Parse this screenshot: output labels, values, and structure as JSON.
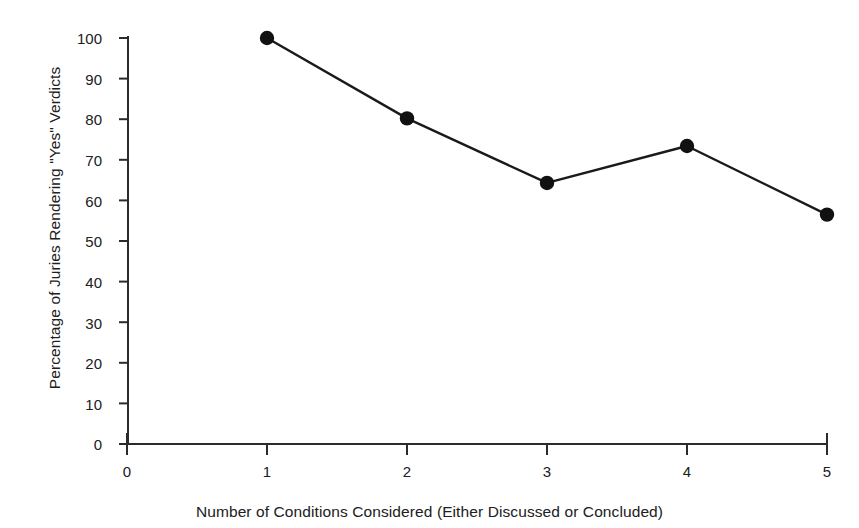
{
  "chart_data": {
    "type": "line",
    "title": "",
    "xlabel": "Number of Conditions Considered (Either Discussed or Concluded)",
    "ylabel": "Percentage of Juries Rendering \"Yes\" Verdicts",
    "x": [
      1,
      2,
      3,
      4,
      5
    ],
    "values": [
      100,
      80.2,
      64.3,
      73.4,
      56.5
    ],
    "series": [
      {
        "name": "Percentage of Juries Rendering \"Yes\" Verdicts",
        "values": [
          100,
          80.2,
          64.3,
          73.4,
          56.5
        ]
      }
    ],
    "points": [
      {
        "x": 1,
        "y": 100
      },
      {
        "x": 2,
        "y": 80.2
      },
      {
        "x": 3,
        "y": 64.3
      },
      {
        "x": 4,
        "y": 73.4
      },
      {
        "x": 5,
        "y": 56.5
      }
    ],
    "xlim": [
      0,
      5
    ],
    "ylim": [
      0,
      100
    ],
    "xticks": [
      0,
      1,
      2,
      3,
      4,
      5
    ],
    "yticks": [
      0,
      10,
      20,
      30,
      40,
      50,
      60,
      70,
      80,
      90,
      100
    ],
    "xtick_labels": [
      "0",
      "1",
      "2",
      "3",
      "4",
      "5"
    ],
    "ytick_labels": [
      "0",
      "10",
      "20",
      "30",
      "40",
      "50",
      "60",
      "70",
      "80",
      "90",
      "100"
    ],
    "grid": false,
    "legend": false,
    "legend_position": "none",
    "marker": "filled-circle",
    "line_color": "#1a1a1a",
    "marker_color": "#111111",
    "background_color": "#ffffff",
    "axis_color": "#2b2b2b"
  }
}
